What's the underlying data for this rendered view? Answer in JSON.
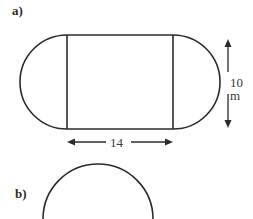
{
  "figures": [
    {
      "label": "a)",
      "shape": "rectangle with semicircles on both ends",
      "dimensions": {
        "length_label": "14",
        "width_label": "10 m"
      }
    },
    {
      "label": "b)",
      "shape": "circle (partially visible)"
    }
  ],
  "colors": {
    "stroke": "#2b2b2b",
    "background": "#ffffff"
  }
}
